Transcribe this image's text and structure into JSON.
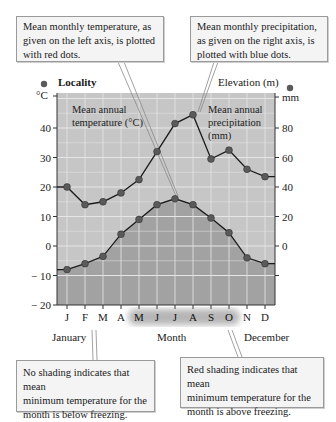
{
  "callouts": {
    "top_left": {
      "line1": "Mean monthly temperature, as",
      "line2": "given on the left axis, is plotted",
      "line3": "with red dots."
    },
    "top_right": {
      "line1": "Mean monthly precipitation,",
      "line2": "as given on the right axis, is",
      "line3": "plotted with blue dots."
    },
    "bottom_left": {
      "line1": "No shading indicates that mean",
      "line2": "minimum temperature for the",
      "line3": "month is below freezing."
    },
    "bottom_right": {
      "line1": "Red shading indicates that mean",
      "line2": "minimum temperature for the",
      "line3": "month is above freezing."
    }
  },
  "header": {
    "locality": "Locality",
    "elevation": "Elevation (m)",
    "left_unit": "°C",
    "right_unit": "mm"
  },
  "inside_labels": {
    "temp_line1": "Mean annual",
    "temp_line2": "temperature (°C)",
    "precip_line1": "Mean annual",
    "precip_line2": "precipitation",
    "precip_line3": "(mm)"
  },
  "footer": {
    "january": "January",
    "month": "Month",
    "december": "December"
  },
  "colors": {
    "plot_light": "#c6c6c6",
    "plot_dark": "#a2a2a2",
    "grid": "#e6e6e6",
    "dot": "#5a5a5a",
    "line": "#1a1a1a",
    "highlight_months": "#555555"
  },
  "chart_data": {
    "type": "line",
    "xlabel": "Month",
    "categories": [
      "J",
      "F",
      "M",
      "A",
      "M",
      "J",
      "J",
      "A",
      "S",
      "O",
      "N",
      "D"
    ],
    "highlighted_categories": [
      "M",
      "J",
      "J",
      "A",
      "S",
      "O"
    ],
    "y_left": {
      "label": "°C",
      "ticks": [
        40,
        30,
        20,
        10,
        0,
        -10,
        -20
      ],
      "range": [
        -20,
        52
      ]
    },
    "y_right": {
      "label": "mm",
      "ticks": [
        80,
        60,
        40,
        20,
        0
      ],
      "range": [
        -40,
        104
      ]
    },
    "series": [
      {
        "name": "Mean monthly temperature (°C)",
        "axis": "left",
        "marker": "red dots",
        "values": [
          -8,
          -6,
          -3.5,
          4,
          9,
          14,
          16,
          14,
          9.5,
          4.5,
          -4,
          -6
        ]
      },
      {
        "name": "Mean monthly precipitation (mm)",
        "axis": "right",
        "marker": "blue dots",
        "values": [
          40,
          28,
          30,
          36,
          45,
          64,
          83,
          89,
          59,
          65,
          52,
          47
        ]
      }
    ],
    "grid": true,
    "legend": "callout boxes"
  }
}
